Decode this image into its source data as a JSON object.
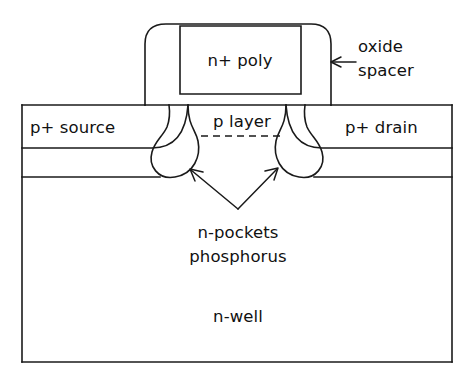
{
  "figure": {
    "kind": "semiconductor-device-cross-section",
    "background_color": "#ffffff",
    "line_color": "#1a1a1a"
  },
  "labels": {
    "gate": "n+ poly",
    "spacer_line1": "oxide",
    "spacer_line2": "spacer",
    "source": "p+ source",
    "drain": "p+ drain",
    "channel": "p layer",
    "pockets_line1": "n-pockets",
    "pockets_line2": "phosphorus",
    "well": "n-well"
  },
  "callouts": [
    {
      "name": "oxide-spacer-callout",
      "text_line1": "oxide",
      "text_line2": "spacer",
      "arrow_from_x": 356,
      "arrow_from_y": 62,
      "arrow_to_x": 331,
      "arrow_to_y": 62
    },
    {
      "name": "n-pockets-callout-left",
      "arrow_from_x": 238,
      "arrow_from_y": 209,
      "arrow_to_x": 190,
      "arrow_to_y": 169
    },
    {
      "name": "n-pockets-callout-right",
      "arrow_from_x": 238,
      "arrow_from_y": 209,
      "arrow_to_x": 278,
      "arrow_to_y": 168
    }
  ],
  "geometry": {
    "substrate_left": 22,
    "substrate_right": 452,
    "substrate_top": 105,
    "substrate_bottom": 362,
    "p_plus_depth_y": 148,
    "nwell_boundary_y": 177,
    "gate_left": 145,
    "gate_right": 331,
    "gate_top": 24,
    "poly_left": 180,
    "poly_right": 301,
    "poly_top": 26,
    "poly_bottom": 94,
    "p_layer_dash_y": 136,
    "p_layer_dash_x1": 201,
    "p_layer_dash_x2": 284
  },
  "text_positions": {
    "gate": {
      "x": 240,
      "y": 66
    },
    "spacer_line1": {
      "x": 358,
      "y": 52
    },
    "spacer_line2": {
      "x": 358,
      "y": 76
    },
    "source": {
      "x": 30,
      "y": 133
    },
    "drain": {
      "x": 345,
      "y": 133
    },
    "channel": {
      "x": 242,
      "y": 127
    },
    "pockets_line1": {
      "x": 238,
      "y": 238
    },
    "pockets_line2": {
      "x": 238,
      "y": 262
    },
    "well": {
      "x": 238,
      "y": 322
    }
  }
}
